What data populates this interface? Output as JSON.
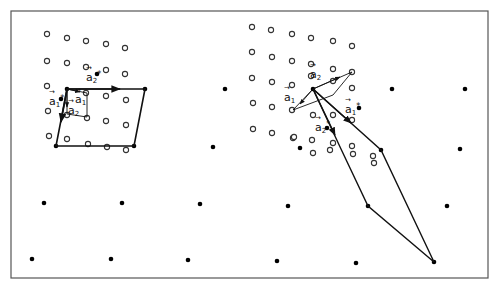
{
  "figure": {
    "frame": {
      "x": 11,
      "y": 11,
      "width": 477,
      "height": 267,
      "stroke": "#555555"
    },
    "colors": {
      "line": "#111111",
      "open_circle": "#333333",
      "dot": "#000000"
    },
    "left_panel": {
      "open_circles": [
        [
          47,
          34
        ],
        [
          67,
          38
        ],
        [
          86,
          41
        ],
        [
          106,
          44
        ],
        [
          125,
          48
        ],
        [
          47,
          61
        ],
        [
          67,
          63
        ],
        [
          86,
          67
        ],
        [
          106,
          70
        ],
        [
          125,
          74
        ],
        [
          47,
          86
        ],
        [
          86,
          93
        ],
        [
          106,
          96
        ],
        [
          126,
          100
        ],
        [
          48,
          111
        ],
        [
          67,
          115
        ],
        [
          87,
          118
        ],
        [
          106,
          121
        ],
        [
          126,
          125
        ],
        [
          49,
          136
        ],
        [
          67,
          139
        ],
        [
          88,
          144
        ],
        [
          107,
          147
        ],
        [
          126,
          150
        ]
      ],
      "filled_dots": [
        [
          67,
          89
        ],
        [
          145,
          89
        ],
        [
          56,
          146
        ],
        [
          134,
          146
        ],
        [
          97,
          74
        ],
        [
          61,
          99
        ]
      ],
      "superlattice_cell": {
        "points": [
          [
            67,
            89
          ],
          [
            145,
            89
          ],
          [
            134,
            146
          ],
          [
            56,
            146
          ]
        ]
      },
      "primitive_cell": {
        "points": [
          [
            67,
            89
          ],
          [
            87,
            93
          ],
          [
            87,
            117
          ],
          [
            67,
            114
          ]
        ]
      },
      "labels": [
        {
          "id": "a2star",
          "base": "a",
          "sub": "2",
          "sup": "*",
          "x": 86,
          "y": 71
        },
        {
          "id": "a1star",
          "base": "a",
          "sub": "1",
          "sup": "*",
          "x": 49,
          "y": 95
        },
        {
          "id": "a1",
          "base": "a",
          "sub": "1",
          "sup": "",
          "x": 75,
          "y": 94
        },
        {
          "id": "a2",
          "base": "a",
          "sub": "2",
          "sup": "",
          "x": 68,
          "y": 105
        }
      ]
    },
    "right_panel": {
      "open_circles": [
        [
          252,
          27
        ],
        [
          271,
          30
        ],
        [
          292,
          34
        ],
        [
          311,
          38
        ],
        [
          333,
          41
        ],
        [
          352,
          46
        ],
        [
          252,
          52
        ],
        [
          272,
          57
        ],
        [
          292,
          61
        ],
        [
          311,
          64
        ],
        [
          333,
          69
        ],
        [
          352,
          72
        ],
        [
          252,
          78
        ],
        [
          272,
          82
        ],
        [
          292,
          85
        ],
        [
          311,
          76
        ],
        [
          333,
          81
        ],
        [
          352,
          88
        ],
        [
          253,
          103
        ],
        [
          272,
          107
        ],
        [
          292,
          110
        ],
        [
          313,
          115
        ],
        [
          333,
          115
        ],
        [
          352,
          120
        ],
        [
          253,
          129
        ],
        [
          272,
          133
        ],
        [
          293,
          138
        ],
        [
          312,
          140
        ],
        [
          333,
          143
        ],
        [
          352,
          146
        ],
        [
          294,
          137
        ],
        [
          313,
          153
        ],
        [
          330,
          150
        ],
        [
          353,
          154
        ],
        [
          373,
          156
        ],
        [
          374,
          163
        ]
      ],
      "filled_dots": [
        [
          313,
          89
        ],
        [
          392,
          89
        ],
        [
          300,
          148
        ],
        [
          381,
          150
        ],
        [
          359,
          108
        ],
        [
          327,
          128
        ],
        [
          465,
          89
        ]
      ],
      "primitive_cell": {
        "points": [
          [
            313,
            89
          ],
          [
            352,
            72
          ],
          [
            333,
            95
          ],
          [
            293,
            110
          ]
        ]
      },
      "superlattice_cell": {
        "points": [
          [
            313,
            89
          ],
          [
            381,
            150
          ],
          [
            434,
            262
          ],
          [
            368,
            206
          ],
          [
            341,
            149
          ]
        ]
      },
      "labels": [
        {
          "id": "a2",
          "base": "a",
          "sub": "2",
          "sup": "",
          "x": 310,
          "y": 69
        },
        {
          "id": "a1",
          "base": "a",
          "sub": "1",
          "sup": "",
          "x": 284,
          "y": 92
        },
        {
          "id": "a1star",
          "base": "a",
          "sub": "1",
          "sup": "*",
          "x": 345,
          "y": 103
        },
        {
          "id": "a2star",
          "base": "a",
          "sub": "2",
          "sup": "*",
          "x": 315,
          "y": 121
        }
      ]
    },
    "lower_dots": [
      [
        44,
        203
      ],
      [
        122,
        203
      ],
      [
        200,
        204
      ],
      [
        288,
        206
      ],
      [
        368,
        206
      ],
      [
        447,
        206
      ],
      [
        32,
        259
      ],
      [
        111,
        259
      ],
      [
        188,
        260
      ],
      [
        277,
        261
      ],
      [
        356,
        263
      ],
      [
        434,
        262
      ],
      [
        225,
        89
      ],
      [
        213,
        147
      ],
      [
        460,
        149
      ]
    ]
  }
}
